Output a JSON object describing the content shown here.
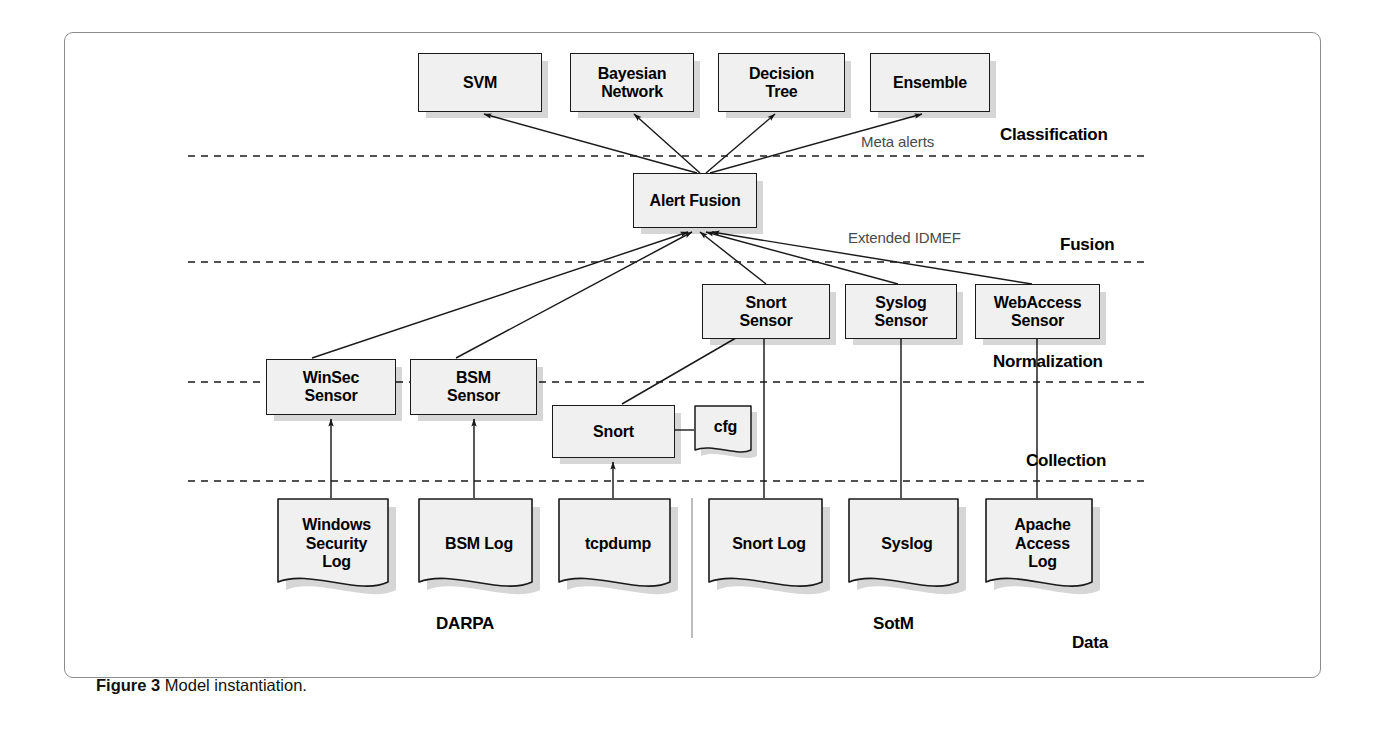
{
  "figure": {
    "caption_label": "Figure 3",
    "caption_text": "Model instantiation."
  },
  "layers": [
    {
      "id": "classification",
      "label": "Classification"
    },
    {
      "id": "fusion",
      "label": "Fusion"
    },
    {
      "id": "normalization",
      "label": "Normalization"
    },
    {
      "id": "collection",
      "label": "Collection"
    },
    {
      "id": "data",
      "label": "Data"
    }
  ],
  "classifiers": [
    {
      "id": "svm",
      "label": "SVM"
    },
    {
      "id": "bayesian-network",
      "label": "Bayesian\nNetwork"
    },
    {
      "id": "decision-tree",
      "label": "Decision\nTree"
    },
    {
      "id": "ensemble",
      "label": "Ensemble"
    }
  ],
  "fusion_node": {
    "id": "alert-fusion",
    "label": "Alert Fusion"
  },
  "sensors": [
    {
      "id": "winsec-sensor",
      "label": "WinSec\nSensor"
    },
    {
      "id": "bsm-sensor",
      "label": "BSM\nSensor"
    },
    {
      "id": "snort-sensor",
      "label": "Snort\nSensor"
    },
    {
      "id": "syslog-sensor",
      "label": "Syslog\nSensor"
    },
    {
      "id": "webaccess-sensor",
      "label": "WebAccess\nSensor"
    }
  ],
  "collectors": [
    {
      "id": "snort",
      "label": "Snort"
    },
    {
      "id": "cfg",
      "label": "cfg"
    }
  ],
  "data_sources": [
    {
      "id": "windows-security-log",
      "label": "Windows\nSecurity\nLog"
    },
    {
      "id": "bsm-log",
      "label": "BSM Log"
    },
    {
      "id": "tcpdump",
      "label": "tcpdump"
    },
    {
      "id": "snort-log",
      "label": "Snort Log"
    },
    {
      "id": "syslog",
      "label": "Syslog"
    },
    {
      "id": "apache-access-log",
      "label": "Apache\nAccess\nLog"
    }
  ],
  "dataset_groups": [
    {
      "id": "darpa",
      "label": "DARPA"
    },
    {
      "id": "sotm",
      "label": "SotM"
    }
  ],
  "flow_labels": [
    {
      "id": "meta-alerts",
      "label": "Meta alerts"
    },
    {
      "id": "extended-idmef",
      "label": "Extended IDMEF"
    }
  ],
  "colors": {
    "node_fill": "#f0f0f0",
    "node_stroke": "#1a1a1a",
    "shadow": "rgba(0,0,0,0.16)",
    "layer_line": "#1a1a1a",
    "frame": "#8c8c8c",
    "flow_label_text": "#4a4a4a"
  }
}
